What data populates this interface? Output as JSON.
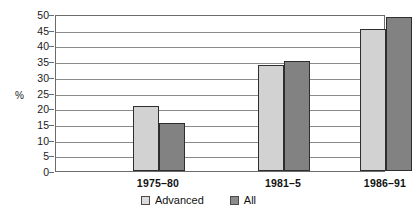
{
  "chart_data": {
    "type": "bar",
    "title": "",
    "xlabel": "",
    "ylabel": "%",
    "ylim": [
      0,
      50
    ],
    "ytick_step": 5,
    "yticks": [
      "50",
      "45",
      "40",
      "35",
      "30",
      "25",
      "20",
      "15",
      "10",
      "5",
      "0"
    ],
    "grid": true,
    "legend_position": "bottom",
    "categories": [
      "1975–80",
      "1981–5",
      "1986–91"
    ],
    "series": [
      {
        "name": "Advanced",
        "color": "#d2d2d2",
        "values": [
          20.7,
          33.8,
          45.2
        ]
      },
      {
        "name": "All",
        "color": "#828282",
        "values": [
          15.3,
          35.0,
          49.0
        ]
      }
    ]
  },
  "legend": {
    "items": [
      {
        "label": "Advanced",
        "swatch": "advanced"
      },
      {
        "label": "All",
        "swatch": "all"
      }
    ]
  },
  "colors": {
    "advanced": "#d2d2d2",
    "all": "#828282",
    "frame": "#6b6b6b",
    "gridline": "#8a8a8a",
    "bar_outline": "#2e2e2e",
    "background": "#ffffff"
  }
}
